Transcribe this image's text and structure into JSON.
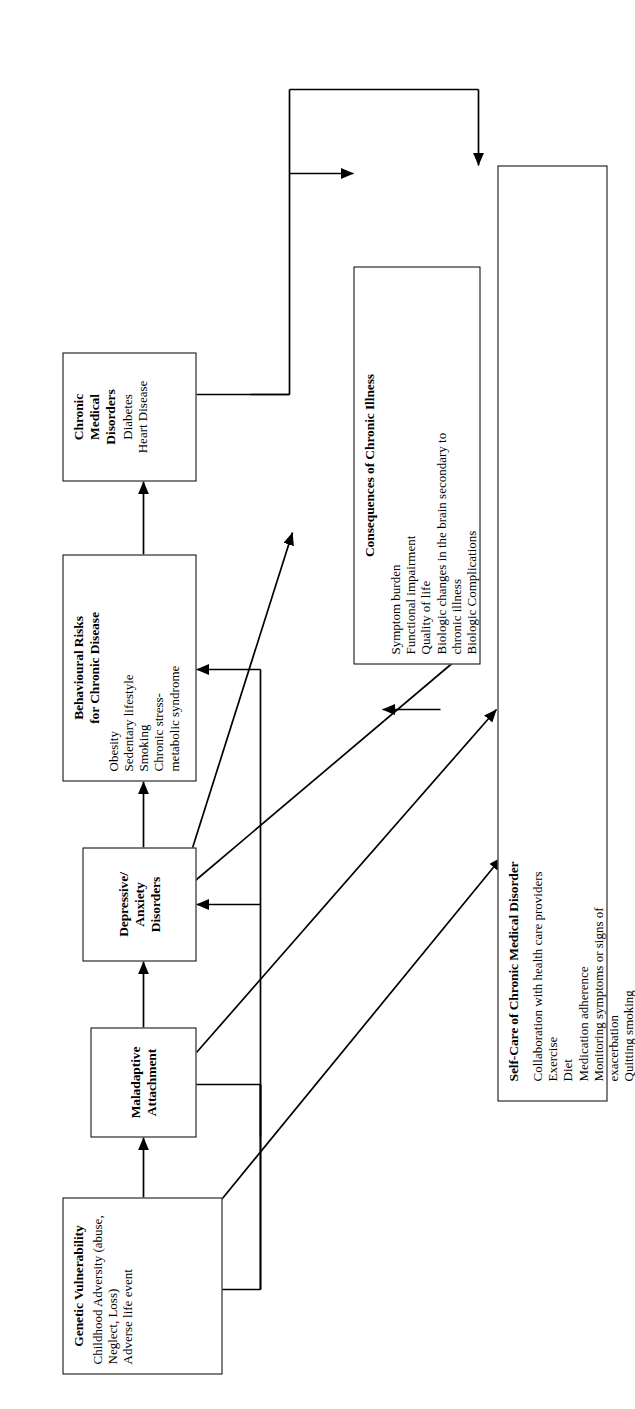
{
  "figure": {
    "type": "flow-diagram",
    "orientation": "rotated-90-ccw",
    "background": "#ffffff",
    "line_color": "#000000"
  },
  "nodes": {
    "genetic_vulnerability": {
      "title": "Genetic Vulnerability",
      "items": [
        "Childhood Adversity (abuse, Neglect, Loss)",
        "Adverse life event"
      ]
    },
    "maladaptive_attachment": {
      "title_line1": "Maladaptive",
      "title_line2": "Attachment",
      "items": []
    },
    "depressive_anxiety": {
      "title_line1": "Depressive/",
      "title_line2": "Anxiety",
      "title_line3": "Disorders",
      "items": []
    },
    "behavioural_risks": {
      "title_line1": "Behavioural Risks",
      "title_line2": "for Chronic Disease",
      "items": [
        "Obesity",
        "Sedentary lifestyle",
        "Smoking",
        "Chronic stress-",
        "metabolic syndrome"
      ]
    },
    "chronic_medical_disorders": {
      "title_line1": "Chronic",
      "title_line2": "Medical",
      "title_line3": "Disorders",
      "items": [
        "Diabetes",
        "Heart Disease"
      ]
    },
    "consequences": {
      "title": "Consequences of Chronic Illness",
      "items": [
        "Symptom burden",
        "Functional impairment",
        "Quality of life",
        "Biologic changes in the brain secondary to",
        "chronic illness",
        "Biologic Complications"
      ]
    },
    "self_care": {
      "title": "Self-Care of Chronic Medical Disorder",
      "items": [
        "Collaboration with health care providers",
        "Exercise",
        "Diet",
        "Medication adherence",
        "Monitoring symptoms or signs of",
        "exacerbation",
        "Quitting smoking"
      ]
    }
  },
  "edges": [
    {
      "name": "genetic-to-maladaptive",
      "from": "genetic_vulnerability",
      "to": "maladaptive_attachment",
      "style": "straight",
      "arrows": "single"
    },
    {
      "name": "maladaptive-to-depressive",
      "from": "maladaptive_attachment",
      "to": "depressive_anxiety",
      "style": "straight",
      "arrows": "single"
    },
    {
      "name": "depressive-to-behavioural",
      "from": "depressive_anxiety",
      "to": "behavioural_risks",
      "style": "straight",
      "arrows": "single"
    },
    {
      "name": "behavioural-to-chronic-medical",
      "from": "behavioural_risks",
      "to": "chronic_medical_disorders",
      "style": "straight",
      "arrows": "single"
    },
    {
      "name": "maladaptive-feedback-bus",
      "from": "maladaptive_attachment",
      "to": "behavioural_risks",
      "style": "bus",
      "arrows": "single"
    },
    {
      "name": "maladaptive-feedback-bus-2",
      "from": "maladaptive_attachment",
      "to": "depressive_anxiety",
      "style": "bus",
      "arrows": "single"
    },
    {
      "name": "chronic-medical-to-consequences",
      "from": "chronic_medical_disorders",
      "to": "consequences",
      "style": "orthogonal",
      "arrows": "single"
    },
    {
      "name": "chronic-medical-to-self-care",
      "from": "chronic_medical_disorders",
      "to": "self_care",
      "style": "orthogonal",
      "arrows": "single"
    },
    {
      "name": "depressive-consequences",
      "from": "depressive_anxiety",
      "to": "consequences",
      "style": "diagonal",
      "arrows": "double"
    },
    {
      "name": "depressive-to-self-care",
      "from": "depressive_anxiety",
      "to": "self_care",
      "style": "diagonal",
      "arrows": "single"
    },
    {
      "name": "maladaptive-to-self-care",
      "from": "maladaptive_attachment",
      "to": "self_care",
      "style": "diagonal",
      "arrows": "single"
    },
    {
      "name": "genetic-to-self-care",
      "from": "genetic_vulnerability",
      "to": "self_care",
      "style": "diagonal",
      "arrows": "single"
    },
    {
      "name": "self-care-to-consequences",
      "from": "self_care",
      "to": "consequences",
      "style": "straight",
      "arrows": "single"
    }
  ]
}
